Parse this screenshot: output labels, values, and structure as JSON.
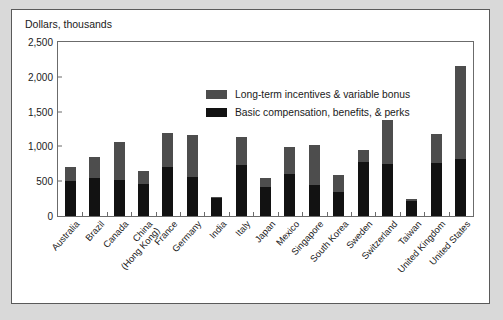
{
  "chart_data": {
    "type": "bar",
    "subtype": "stacked-vertical",
    "title": "",
    "ylabel": "Dollars, thousands",
    "xlabel": "",
    "ylim": [
      0,
      2500
    ],
    "ytick_labels": [
      "0",
      "500",
      "1,000",
      "1,500",
      "2,000",
      "2,500"
    ],
    "ytick_values": [
      0,
      500,
      1000,
      1500,
      2000,
      2500
    ],
    "grid": false,
    "legend_position": "upper-center",
    "categories": [
      "Australia",
      "Brazil",
      "Canada",
      "China (Hong Kong)",
      "France",
      "Germany",
      "India",
      "Italy",
      "Japan",
      "Mexico",
      "Singapore",
      "South Korea",
      "Sweden",
      "Switzerland",
      "Taiwan",
      "United Kingdom",
      "United States"
    ],
    "category_lines": [
      [
        "Australia"
      ],
      [
        "Brazil"
      ],
      [
        "Canada"
      ],
      [
        "China",
        "(Hong Kong)"
      ],
      [
        "France"
      ],
      [
        "Germany"
      ],
      [
        "India"
      ],
      [
        "Italy"
      ],
      [
        "Japan"
      ],
      [
        "Mexico"
      ],
      [
        "Singapore"
      ],
      [
        "South Korea"
      ],
      [
        "Sweden"
      ],
      [
        "Switzerland"
      ],
      [
        "Taiwan"
      ],
      [
        "United Kingdom"
      ],
      [
        "United States"
      ]
    ],
    "series": [
      {
        "name": "Basic compensation, benefits, & perks",
        "color": "#121212",
        "values": [
          500,
          545,
          520,
          465,
          700,
          560,
          255,
          730,
          420,
          600,
          440,
          345,
          770,
          745,
          215,
          760,
          815
        ]
      },
      {
        "name": "Long-term incentives & variable bonus",
        "color": "#4d4d4d",
        "values": [
          210,
          305,
          540,
          185,
          490,
          610,
          25,
          400,
          120,
          395,
          580,
          245,
          175,
          635,
          25,
          415,
          1345
        ]
      }
    ],
    "totals": [
      710,
      850,
      1060,
      650,
      1190,
      1170,
      280,
      1130,
      540,
      995,
      1020,
      590,
      945,
      1380,
      240,
      1175,
      2160
    ]
  },
  "legend": {
    "items": [
      {
        "label": "Long-term incentives & variable bonus",
        "swatch": "series-top"
      },
      {
        "label": "Basic compensation, benefits, & perks",
        "swatch": "series-bottom"
      }
    ]
  },
  "colors": {
    "page_background": "#d9d9d9",
    "panel_background": "#ffffff",
    "panel_border": "#5a5a5a",
    "axis": "#6b6b6b",
    "text": "#1a1a1a",
    "series_top": "#4d4d4d",
    "series_bottom": "#121212"
  }
}
